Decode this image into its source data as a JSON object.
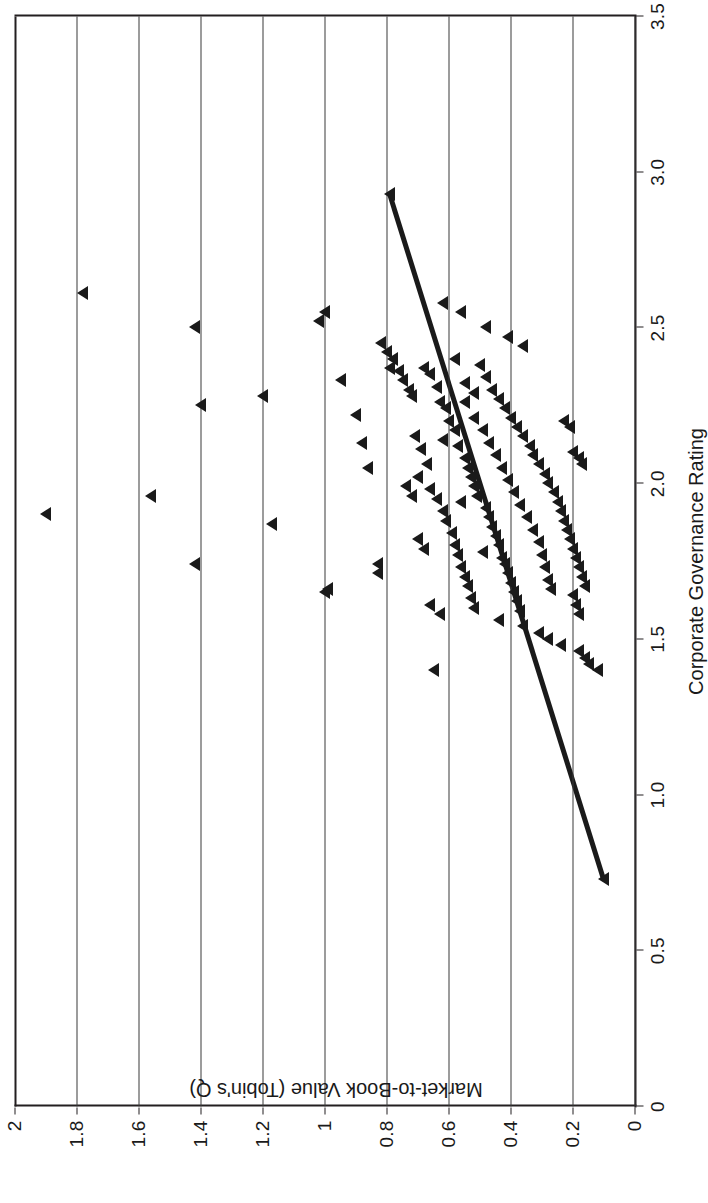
{
  "figure": {
    "background": "#ffffff",
    "ink": "#1a1a1a",
    "gridline_color": "#3a3a3a"
  },
  "chart_data": {
    "type": "scatter",
    "title": "",
    "xlabel": "Corporate Governance Rating",
    "ylabel": "Market-to-Book Value (Tobin's Q)",
    "xlim": [
      0,
      3.5
    ],
    "ylim": [
      0,
      2
    ],
    "xticks": [
      "0",
      "0.5",
      "1.0",
      "1.5",
      "2.0",
      "2.5",
      "3.0",
      "3.5"
    ],
    "xtick_values": [
      0,
      0.5,
      1.0,
      1.5,
      2.0,
      2.5,
      3.0,
      3.5
    ],
    "yticks": [
      "0",
      "0.2",
      "0.4",
      "0.6",
      "0.8",
      "1",
      "1.2",
      "1.4",
      "1.6",
      "1.8",
      "2"
    ],
    "ytick_values": [
      0,
      0.2,
      0.4,
      0.6,
      0.8,
      1.0,
      1.2,
      1.4,
      1.6,
      1.8,
      2.0
    ],
    "grid": "horizontal",
    "legend": null,
    "marker": "triangle",
    "marker_color": "#1a1a1a",
    "trendline": {
      "kind": "linear-fit",
      "color": "#1a1a1a",
      "width_px": 5,
      "x_start": 0.73,
      "y_start": 0.1,
      "x_end": 2.93,
      "y_end": 0.79,
      "slope": -0.3136,
      "intercept": 1.0188
    },
    "points": [
      [
        1.9,
        1.9
      ],
      [
        2.61,
        1.78
      ],
      [
        2.5,
        1.42
      ],
      [
        2.25,
        1.4
      ],
      [
        1.96,
        1.56
      ],
      [
        1.74,
        1.42
      ],
      [
        2.28,
        1.2
      ],
      [
        1.87,
        1.17
      ],
      [
        2.52,
        1.02
      ],
      [
        2.55,
        1.0
      ],
      [
        1.65,
        1.0
      ],
      [
        1.66,
        0.99
      ],
      [
        2.33,
        0.95
      ],
      [
        2.22,
        0.9
      ],
      [
        2.13,
        0.88
      ],
      [
        2.05,
        0.86
      ],
      [
        1.74,
        0.83
      ],
      [
        1.71,
        0.83
      ],
      [
        1.4,
        0.65
      ],
      [
        2.93,
        0.79
      ],
      [
        2.45,
        0.82
      ],
      [
        2.42,
        0.8
      ],
      [
        2.4,
        0.78
      ],
      [
        2.37,
        0.79
      ],
      [
        2.36,
        0.76
      ],
      [
        2.33,
        0.75
      ],
      [
        2.3,
        0.73
      ],
      [
        2.28,
        0.72
      ],
      [
        2.37,
        0.68
      ],
      [
        2.35,
        0.66
      ],
      [
        2.31,
        0.64
      ],
      [
        2.26,
        0.63
      ],
      [
        2.24,
        0.61
      ],
      [
        2.2,
        0.6
      ],
      [
        2.17,
        0.58
      ],
      [
        2.14,
        0.62
      ],
      [
        2.12,
        0.57
      ],
      [
        2.08,
        0.55
      ],
      [
        2.05,
        0.54
      ],
      [
        2.02,
        0.53
      ],
      [
        1.99,
        0.52
      ],
      [
        1.96,
        0.51
      ],
      [
        1.94,
        0.56
      ],
      [
        1.92,
        0.48
      ],
      [
        1.89,
        0.47
      ],
      [
        1.86,
        0.46
      ],
      [
        1.83,
        0.45
      ],
      [
        1.8,
        0.44
      ],
      [
        1.78,
        0.49
      ],
      [
        1.76,
        0.43
      ],
      [
        1.74,
        0.42
      ],
      [
        1.71,
        0.41
      ],
      [
        1.68,
        0.4
      ],
      [
        1.65,
        0.39
      ],
      [
        1.62,
        0.38
      ],
      [
        1.59,
        0.37
      ],
      [
        2.4,
        0.58
      ],
      [
        2.38,
        0.5
      ],
      [
        2.34,
        0.48
      ],
      [
        2.3,
        0.46
      ],
      [
        2.27,
        0.44
      ],
      [
        2.24,
        0.42
      ],
      [
        2.21,
        0.4
      ],
      [
        2.18,
        0.38
      ],
      [
        2.15,
        0.36
      ],
      [
        2.12,
        0.34
      ],
      [
        2.09,
        0.33
      ],
      [
        2.06,
        0.31
      ],
      [
        2.03,
        0.29
      ],
      [
        2.0,
        0.28
      ],
      [
        1.97,
        0.26
      ],
      [
        1.94,
        0.25
      ],
      [
        1.91,
        0.24
      ],
      [
        1.88,
        0.23
      ],
      [
        1.85,
        0.22
      ],
      [
        1.82,
        0.21
      ],
      [
        1.79,
        0.2
      ],
      [
        1.76,
        0.19
      ],
      [
        1.73,
        0.18
      ],
      [
        1.7,
        0.17
      ],
      [
        1.67,
        0.16
      ],
      [
        1.64,
        0.2
      ],
      [
        1.61,
        0.19
      ],
      [
        1.58,
        0.18
      ],
      [
        2.26,
        0.55
      ],
      [
        2.21,
        0.52
      ],
      [
        2.17,
        0.49
      ],
      [
        2.13,
        0.47
      ],
      [
        2.09,
        0.45
      ],
      [
        2.05,
        0.43
      ],
      [
        2.01,
        0.41
      ],
      [
        1.97,
        0.39
      ],
      [
        1.93,
        0.37
      ],
      [
        1.89,
        0.35
      ],
      [
        1.85,
        0.33
      ],
      [
        1.81,
        0.31
      ],
      [
        1.77,
        0.3
      ],
      [
        1.73,
        0.29
      ],
      [
        1.69,
        0.28
      ],
      [
        1.66,
        0.27
      ],
      [
        2.15,
        0.71
      ],
      [
        2.11,
        0.69
      ],
      [
        2.06,
        0.67
      ],
      [
        2.02,
        0.7
      ],
      [
        1.98,
        0.66
      ],
      [
        1.95,
        0.64
      ],
      [
        1.91,
        0.62
      ],
      [
        1.88,
        0.61
      ],
      [
        1.84,
        0.59
      ],
      [
        1.8,
        0.58
      ],
      [
        1.77,
        0.57
      ],
      [
        1.73,
        0.56
      ],
      [
        1.7,
        0.55
      ],
      [
        1.67,
        0.54
      ],
      [
        1.63,
        0.53
      ],
      [
        1.6,
        0.52
      ],
      [
        2.5,
        0.48
      ],
      [
        2.47,
        0.41
      ],
      [
        2.44,
        0.36
      ],
      [
        2.2,
        0.23
      ],
      [
        2.18,
        0.21
      ],
      [
        2.1,
        0.2
      ],
      [
        2.08,
        0.18
      ],
      [
        2.06,
        0.17
      ],
      [
        1.56,
        0.44
      ],
      [
        1.54,
        0.36
      ],
      [
        1.52,
        0.31
      ],
      [
        1.5,
        0.28
      ],
      [
        1.48,
        0.24
      ],
      [
        1.46,
        0.18
      ],
      [
        1.44,
        0.16
      ],
      [
        1.42,
        0.15
      ],
      [
        1.4,
        0.12
      ],
      [
        2.58,
        0.62
      ],
      [
        2.55,
        0.56
      ],
      [
        2.32,
        0.55
      ],
      [
        2.29,
        0.52
      ],
      [
        1.99,
        0.74
      ],
      [
        1.96,
        0.72
      ],
      [
        1.82,
        0.7
      ],
      [
        1.79,
        0.68
      ],
      [
        1.61,
        0.66
      ],
      [
        1.58,
        0.63
      ],
      [
        0.73,
        0.1
      ]
    ]
  }
}
